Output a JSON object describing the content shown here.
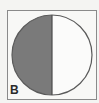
{
  "figure": {
    "label": "B",
    "shaded_fraction": "1/2",
    "colors": {
      "shaded": "#7a7a7a",
      "unshaded": "#fbfbfa",
      "outline": "#5a5a5a",
      "frame": "#8a8a8a",
      "background": "#f4f4f2"
    }
  }
}
